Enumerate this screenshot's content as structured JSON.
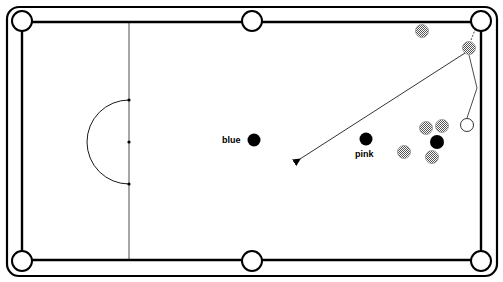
{
  "diagram": {
    "type": "snooker-table",
    "labels": {
      "blue": "blue",
      "pink": "pink"
    },
    "colors": {
      "line": "#000000",
      "background": "#ffffff",
      "red_fill": "#bdbdbd",
      "cue_ball_fill": "#ffffff",
      "colour_ball_fill": "#000000"
    },
    "table": {
      "outer": {
        "x": 7,
        "y": 7,
        "width": 490,
        "height": 269,
        "radius": 12
      },
      "cushion": {
        "x1": 22,
        "y1": 22,
        "x2": 481,
        "y2": 260
      }
    },
    "pockets": [
      {
        "name": "top-left",
        "x": 22,
        "y": 21
      },
      {
        "name": "top-middle",
        "x": 252,
        "y": 21
      },
      {
        "name": "top-right",
        "x": 481,
        "y": 21
      },
      {
        "name": "bottom-left",
        "x": 22,
        "y": 261
      },
      {
        "name": "bottom-middle",
        "x": 252,
        "y": 261
      },
      {
        "name": "bottom-right",
        "x": 481,
        "y": 261
      }
    ],
    "baulk_line_x": 129,
    "d": {
      "cx": 129,
      "cy": 142,
      "r": 42
    },
    "spots": [
      {
        "name": "green-spot",
        "x": 129,
        "y": 100
      },
      {
        "name": "brown-spot",
        "x": 129,
        "y": 142
      },
      {
        "name": "yellow-spot",
        "x": 129,
        "y": 184
      }
    ],
    "balls": {
      "blue": {
        "x": 254,
        "y": 140
      },
      "pink": {
        "x": 366,
        "y": 139
      },
      "black": {
        "x": 437,
        "y": 142
      },
      "cue": {
        "x": 467,
        "y": 125
      },
      "reds": [
        {
          "x": 422,
          "y": 31
        },
        {
          "x": 469,
          "y": 48
        },
        {
          "x": 426,
          "y": 128
        },
        {
          "x": 442,
          "y": 126
        },
        {
          "x": 404,
          "y": 152
        },
        {
          "x": 432,
          "y": 157
        }
      ]
    },
    "paths": {
      "cue_ball_path": [
        [
          467,
          118
        ],
        [
          477,
          88
        ],
        [
          469,
          55
        ]
      ],
      "red_path": [
        [
          465,
          53
        ],
        [
          298,
          160
        ]
      ],
      "red_to_pocket_hint": [
        [
          471,
          40
        ],
        [
          475,
          30
        ]
      ]
    }
  }
}
